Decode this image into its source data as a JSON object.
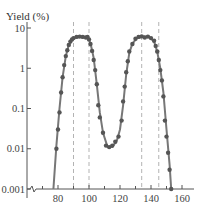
{
  "chart_data": {
    "type": "scatter",
    "title": "",
    "xlabel": "",
    "ylabel": "Yield (%)",
    "yscale": "log",
    "xlim": [
      70,
      162
    ],
    "ylim": [
      0.001,
      10
    ],
    "grid": false,
    "legend": null,
    "x_ticks": [
      80,
      100,
      120,
      140,
      160
    ],
    "x_minor_ticks": [
      70,
      90,
      110,
      130,
      150
    ],
    "y_ticks": [
      {
        "value": 10,
        "label": "10"
      },
      {
        "value": 1,
        "label": "1"
      },
      {
        "value": 0.1,
        "label": "0.1"
      },
      {
        "value": 0.01,
        "label": "0.01"
      },
      {
        "value": 0.001,
        "label": "0.001"
      }
    ],
    "axis_break": "y-axis broken at 0.001 (zigzag)",
    "dashed_vertical_lines": [
      90,
      100,
      134,
      145
    ],
    "series": [
      {
        "name": "measured points",
        "style": "dots",
        "points": [
          [
            79,
            0.01
          ],
          [
            80,
            0.03
          ],
          [
            81,
            0.08
          ],
          [
            82,
            0.25
          ],
          [
            83,
            0.6
          ],
          [
            84,
            1.2
          ],
          [
            85,
            2.0
          ],
          [
            86,
            2.8
          ],
          [
            87,
            3.8
          ],
          [
            88,
            4.6
          ],
          [
            89,
            5.2
          ],
          [
            90,
            5.6
          ],
          [
            92,
            6.0
          ],
          [
            94,
            6.1
          ],
          [
            96,
            6.0
          ],
          [
            98,
            5.8
          ],
          [
            99,
            6.0
          ],
          [
            100,
            5.2
          ],
          [
            101,
            4.0
          ],
          [
            102,
            2.7
          ],
          [
            103,
            1.6
          ],
          [
            104,
            0.9
          ],
          [
            105,
            0.4
          ],
          [
            106,
            0.12
          ],
          [
            107,
            0.06
          ],
          [
            109,
            0.025
          ],
          [
            111,
            0.012
          ],
          [
            113,
            0.011
          ],
          [
            115,
            0.012
          ],
          [
            117,
            0.015
          ],
          [
            119,
            0.02
          ],
          [
            121,
            0.05
          ],
          [
            122,
            0.15
          ],
          [
            123,
            0.35
          ],
          [
            124,
            0.8
          ],
          [
            125,
            1.5
          ],
          [
            126,
            2.6
          ],
          [
            128,
            4.0
          ],
          [
            130,
            5.4
          ],
          [
            132,
            6.0
          ],
          [
            134,
            6.2
          ],
          [
            136,
            5.8
          ],
          [
            138,
            6.1
          ],
          [
            140,
            5.6
          ],
          [
            142,
            4.8
          ],
          [
            143,
            3.6
          ],
          [
            144,
            2.6
          ],
          [
            145,
            1.6
          ],
          [
            146,
            0.9
          ],
          [
            147,
            0.5
          ],
          [
            148,
            0.2
          ],
          [
            149,
            0.05
          ],
          [
            150,
            0.02
          ],
          [
            151,
            0.008
          ],
          [
            152,
            0.003
          ],
          [
            153,
            0.001
          ]
        ]
      },
      {
        "name": "fit curve",
        "style": "line",
        "points": [
          [
            77,
            0.001
          ],
          [
            79,
            0.012
          ],
          [
            81,
            0.1
          ],
          [
            83,
            0.6
          ],
          [
            85,
            2.0
          ],
          [
            87,
            3.8
          ],
          [
            89,
            5.2
          ],
          [
            91,
            5.9
          ],
          [
            95,
            6.1
          ],
          [
            99,
            5.8
          ],
          [
            101,
            4.2
          ],
          [
            103,
            1.8
          ],
          [
            105,
            0.4
          ],
          [
            107,
            0.08
          ],
          [
            109,
            0.025
          ],
          [
            112,
            0.011
          ],
          [
            115,
            0.011
          ],
          [
            118,
            0.016
          ],
          [
            120,
            0.03
          ],
          [
            122,
            0.12
          ],
          [
            124,
            0.7
          ],
          [
            126,
            2.4
          ],
          [
            128,
            4.1
          ],
          [
            131,
            5.7
          ],
          [
            135,
            6.1
          ],
          [
            139,
            5.9
          ],
          [
            142,
            4.6
          ],
          [
            144,
            2.6
          ],
          [
            146,
            1.0
          ],
          [
            148,
            0.25
          ],
          [
            150,
            0.03
          ],
          [
            152,
            0.004
          ],
          [
            153,
            0.001
          ]
        ]
      }
    ]
  }
}
